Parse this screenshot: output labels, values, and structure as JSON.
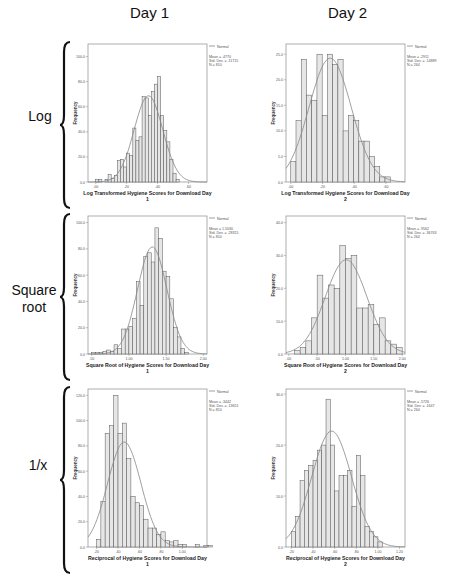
{
  "columns": [
    "Day 1",
    "Day 2"
  ],
  "rows": [
    "Log",
    "Square root",
    "1/x"
  ],
  "colors": {
    "bar_fill": "#e6e6e6",
    "bar_stroke": "#555555",
    "curve": "#888888",
    "frame": "#999999",
    "text": "#111111"
  },
  "note": "Mean/SD/N values below were not legible in the screenshot; they are unverified estimates recalled from the Field textbook figure this appears to reproduce.",
  "chart_data": [
    {
      "type": "bar",
      "row": "Log",
      "col": "Day 1",
      "title": "",
      "xlabel": "Log Transformed Hygiene Scores for Download Day 1",
      "ylabel": "Frequency",
      "legend": "Normal",
      "stats": {
        "mean": "Mean = .4770",
        "sd": "Std. Dev. = .11715",
        "n": "N = 810"
      },
      "stats_unverified": true,
      "xlim": [
        -0.05,
        0.72
      ],
      "ylim": [
        0,
        110
      ],
      "xticks": [
        0.0,
        0.2,
        0.4,
        0.6
      ],
      "xtick_labels": [
        ".00",
        ".20",
        ".40",
        ".60"
      ],
      "yticks": [
        0,
        20,
        40,
        60,
        80,
        100
      ],
      "ytick_labels": [
        "0.0",
        "20.0",
        "40.0",
        "60.0",
        "80.0",
        "100.0"
      ],
      "bin_start": 0.0,
      "bin_width": 0.02,
      "values": [
        2,
        2,
        0,
        2,
        6,
        3,
        5,
        17,
        18,
        12,
        23,
        21,
        43,
        33,
        36,
        68,
        67,
        53,
        72,
        78,
        84,
        53,
        41,
        32,
        18,
        7,
        2
      ]
    },
    {
      "type": "bar",
      "row": "Log",
      "col": "Day 2",
      "title": "",
      "xlabel": "Log Transformed Hygiene Scores for Download Day 2",
      "ylabel": "Frequency",
      "legend": "Normal",
      "stats": {
        "mean": "Mean = .2911",
        "sd": "Std. Dev. = .14889",
        "n": "N = 264"
      },
      "stats_unverified": true,
      "xlim": [
        -0.03,
        0.72
      ],
      "ylim": [
        0,
        27
      ],
      "xticks": [
        0.0,
        0.2,
        0.4,
        0.6
      ],
      "xtick_labels": [
        ".00",
        ".20",
        ".40",
        ".60"
      ],
      "yticks": [
        0,
        5,
        10,
        15,
        20,
        25
      ],
      "ytick_labels": [
        "0.0",
        "5.0",
        "10.0",
        "15.0",
        "20.0",
        "25.0"
      ],
      "bin_start": 0.0,
      "bin_width": 0.033,
      "values": [
        4,
        12,
        24,
        17,
        16,
        25,
        13,
        25,
        23,
        24,
        10,
        13,
        12,
        8,
        8,
        5,
        3,
        1,
        1
      ]
    },
    {
      "type": "bar",
      "row": "Square root",
      "col": "Day 1",
      "title": "",
      "xlabel": "Square Root of Hygiene Scores for Download Day 1",
      "ylabel": "Frequency",
      "legend": "Normal",
      "stats": {
        "mean": "Mean = 1.5030",
        "sd": "Std. Dev. = .28315",
        "n": "N = 810"
      },
      "stats_unverified": true,
      "xlim": [
        0.45,
        2.05
      ],
      "ylim": [
        0,
        105
      ],
      "xticks": [
        0.5,
        1.0,
        1.5,
        2.0
      ],
      "xtick_labels": [
        ".50",
        "1.00",
        "1.50",
        "2.00"
      ],
      "yticks": [
        0,
        20,
        40,
        60,
        80,
        100
      ],
      "ytick_labels": [
        "0.0",
        "20.0",
        "40.0",
        "60.0",
        "80.0",
        "100.0"
      ],
      "bin_start": 0.5,
      "bin_width": 0.05,
      "values": [
        1,
        1,
        1,
        2,
        3,
        2,
        7,
        4,
        19,
        19,
        21,
        27,
        55,
        37,
        74,
        77,
        70,
        96,
        88,
        63,
        59,
        42,
        20,
        13,
        4,
        1
      ]
    },
    {
      "type": "bar",
      "row": "Square root",
      "col": "Day 2",
      "title": "",
      "xlabel": "Square Root of Hygiene Scores for Download Day 2",
      "ylabel": "Frequency",
      "legend": "Normal",
      "stats": {
        "mean": "Mean = .9562",
        "sd": "Std. Dev. = .36763",
        "n": "N = 264"
      },
      "stats_unverified": true,
      "xlim": [
        -0.05,
        2.05
      ],
      "ylim": [
        0,
        42
      ],
      "xticks": [
        0.0,
        0.5,
        1.0,
        1.5,
        2.0
      ],
      "xtick_labels": [
        ".00",
        ".50",
        "1.00",
        "1.50",
        "2.00"
      ],
      "yticks": [
        0,
        10,
        20,
        30,
        40
      ],
      "ytick_labels": [
        "0.0",
        "10.0",
        "20.0",
        "30.0",
        "40.0"
      ],
      "bin_start": 0.1,
      "bin_width": 0.1,
      "values": [
        1,
        2,
        4,
        11,
        24,
        17,
        21,
        20,
        33,
        29,
        30,
        14,
        14,
        15,
        9,
        11,
        4,
        3,
        2
      ]
    },
    {
      "type": "bar",
      "row": "1/x",
      "col": "Day 1",
      "title": "",
      "xlabel": "Reciprocal of Hygiene Scores for Download Day 1",
      "ylabel": "Frequency",
      "legend": "Normal",
      "stats": {
        "mean": "Mean = .3442",
        "sd": "Std. Dev. = .13651",
        "n": "N = 810"
      },
      "stats_unverified": true,
      "xlim": [
        0.12,
        1.23
      ],
      "ylim": [
        0,
        125
      ],
      "xticks": [
        0.2,
        0.4,
        0.6,
        0.8,
        1.0
      ],
      "xtick_labels": [
        ".20",
        ".40",
        ".60",
        ".80",
        "1.00"
      ],
      "bin_start": 0.2,
      "bin_width": 0.04,
      "yticks": [
        0,
        20,
        40,
        60,
        80,
        100,
        120
      ],
      "ytick_labels": [
        "0.0",
        "20.0",
        "40.0",
        "60.0",
        "80.0",
        "100.0",
        "120.0"
      ],
      "values": [
        6,
        36,
        90,
        96,
        120,
        90,
        98,
        70,
        40,
        35,
        33,
        22,
        15,
        15,
        10,
        12,
        5,
        4,
        5,
        2,
        2,
        0,
        0,
        2,
        0,
        1,
        1
      ]
    },
    {
      "type": "bar",
      "row": "1/x",
      "col": "Day 2",
      "title": "",
      "xlabel": "Reciprocal of Hygiene Scores for Download Day 2",
      "ylabel": "Frequency",
      "legend": "Normal",
      "stats": {
        "mean": "Mean = .5726",
        "sd": "Std. Dev. = .1647",
        "n": "N = 264"
      },
      "stats_unverified": true,
      "xlim": [
        0.15,
        1.25
      ],
      "ylim": [
        0,
        31
      ],
      "xticks": [
        0.2,
        0.4,
        0.6,
        0.8,
        1.0,
        1.2
      ],
      "xtick_labels": [
        ".20",
        ".40",
        ".60",
        ".80",
        "1.00",
        "1.20"
      ],
      "bin_start": 0.2,
      "bin_width": 0.04,
      "yticks": [
        0,
        10,
        20,
        30
      ],
      "ytick_labels": [
        "0.0",
        "10.0",
        "20.0",
        "30.0"
      ],
      "values": [
        3,
        6,
        13,
        15,
        16,
        17,
        19,
        20,
        29,
        20,
        11,
        14,
        14,
        15,
        8,
        18,
        14,
        4,
        3,
        2,
        1
      ]
    }
  ]
}
